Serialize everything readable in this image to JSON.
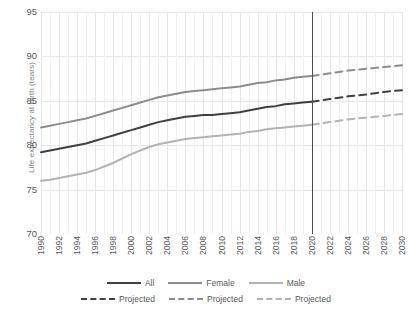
{
  "chart_data": {
    "type": "line",
    "title": "",
    "xlabel": "",
    "ylabel": "Life expectancy at birth (tears)",
    "ylim": [
      70,
      95
    ],
    "yticks": [
      70,
      75,
      80,
      85,
      90,
      95
    ],
    "xlim": [
      1990,
      2030
    ],
    "xticks": [
      1990,
      1992,
      1994,
      1996,
      1998,
      2000,
      2002,
      2004,
      2006,
      2008,
      2010,
      2012,
      2014,
      2016,
      2018,
      2020,
      2022,
      2024,
      2026,
      2028,
      2030
    ],
    "grid": "both",
    "legend_position": "bottom",
    "projection_divider_x": 2020,
    "x": [
      1990,
      1991,
      1992,
      1993,
      1994,
      1995,
      1996,
      1997,
      1998,
      1999,
      2000,
      2001,
      2002,
      2003,
      2004,
      2005,
      2006,
      2007,
      2008,
      2009,
      2010,
      2011,
      2012,
      2013,
      2014,
      2015,
      2016,
      2017,
      2018,
      2019,
      2020
    ],
    "x_projected": [
      2020,
      2021,
      2022,
      2023,
      2024,
      2025,
      2026,
      2027,
      2028,
      2029,
      2030
    ],
    "series": [
      {
        "name": "Female",
        "color": "#8c8c8c",
        "style": "solid",
        "values": [
          82.0,
          82.2,
          82.4,
          82.6,
          82.8,
          83.0,
          83.3,
          83.6,
          83.9,
          84.2,
          84.5,
          84.8,
          85.1,
          85.4,
          85.6,
          85.8,
          86.0,
          86.1,
          86.2,
          86.3,
          86.4,
          86.5,
          86.6,
          86.8,
          87.0,
          87.1,
          87.3,
          87.4,
          87.6,
          87.7,
          87.8
        ]
      },
      {
        "name": "All",
        "color": "#404040",
        "style": "solid",
        "values": [
          79.2,
          79.4,
          79.6,
          79.8,
          80.0,
          80.2,
          80.5,
          80.8,
          81.1,
          81.4,
          81.7,
          82.0,
          82.3,
          82.6,
          82.8,
          83.0,
          83.2,
          83.3,
          83.4,
          83.4,
          83.5,
          83.6,
          83.7,
          83.9,
          84.1,
          84.3,
          84.4,
          84.6,
          84.7,
          84.8,
          84.9
        ]
      },
      {
        "name": "Male",
        "color": "#b3b3b3",
        "style": "solid",
        "values": [
          76.0,
          76.1,
          76.3,
          76.5,
          76.7,
          76.9,
          77.2,
          77.6,
          78.0,
          78.5,
          79.0,
          79.4,
          79.8,
          80.1,
          80.3,
          80.5,
          80.7,
          80.8,
          80.9,
          81.0,
          81.1,
          81.2,
          81.3,
          81.5,
          81.6,
          81.8,
          81.9,
          82.0,
          82.1,
          82.2,
          82.3
        ]
      }
    ],
    "projected_series": [
      {
        "name": "Projected Female",
        "color": "#8c8c8c",
        "style": "dashed",
        "values": [
          87.8,
          87.95,
          88.1,
          88.25,
          88.4,
          88.5,
          88.6,
          88.7,
          88.8,
          88.9,
          89.0
        ]
      },
      {
        "name": "Projected All",
        "color": "#404040",
        "style": "dashed",
        "values": [
          84.9,
          85.05,
          85.2,
          85.35,
          85.5,
          85.6,
          85.7,
          85.85,
          86.0,
          86.1,
          86.2
        ]
      },
      {
        "name": "Projected Male",
        "color": "#b3b3b3",
        "style": "dashed",
        "values": [
          82.3,
          82.45,
          82.6,
          82.75,
          82.9,
          83.0,
          83.1,
          83.2,
          83.3,
          83.4,
          83.5
        ]
      }
    ]
  },
  "axis": {
    "ylabel": "Life expectancy at birth (tears)",
    "yticks": [
      "95",
      "90",
      "85",
      "80",
      "75",
      "70"
    ],
    "xticks": [
      "1990",
      "1992",
      "1994",
      "1996",
      "1998",
      "2000",
      "2002",
      "2004",
      "2006",
      "2008",
      "2010",
      "2012",
      "2014",
      "2016",
      "2018",
      "2020",
      "2022",
      "2024",
      "2026",
      "2028",
      "2030"
    ]
  },
  "legend": {
    "row1": [
      {
        "label": "All",
        "color": "#404040",
        "style": "solid"
      },
      {
        "label": "Female",
        "color": "#8c8c8c",
        "style": "solid"
      },
      {
        "label": "Male",
        "color": "#b3b3b3",
        "style": "solid"
      }
    ],
    "row2": [
      {
        "label": "Projected",
        "color": "#404040",
        "style": "dashed"
      },
      {
        "label": "Projected",
        "color": "#8c8c8c",
        "style": "dashed"
      },
      {
        "label": "Projected",
        "color": "#b3b3b3",
        "style": "dashed"
      }
    ]
  }
}
